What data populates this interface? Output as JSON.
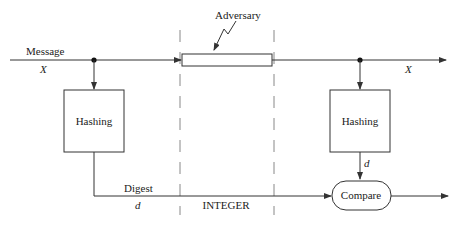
{
  "diagram": {
    "type": "message-integrity-hash-flow",
    "labels": {
      "message": "Message",
      "message_var": "X",
      "output_var": "X",
      "adversary": "Adversary",
      "hashing_left": "Hashing",
      "hashing_right": "Hashing",
      "digest": "Digest",
      "digest_var": "d",
      "right_digest_var": "d",
      "compare": "Compare",
      "channel": "INTEGER"
    },
    "nodes": [
      {
        "id": "hash-sender",
        "label": "Hashing",
        "shape": "rect"
      },
      {
        "id": "channel",
        "label": "",
        "shape": "rect"
      },
      {
        "id": "hash-receiver",
        "label": "Hashing",
        "shape": "rect"
      },
      {
        "id": "compare",
        "label": "Compare",
        "shape": "pill"
      }
    ],
    "edges": [
      {
        "from": "input",
        "to": "channel",
        "label": "Message X"
      },
      {
        "from": "input",
        "to": "hash-sender"
      },
      {
        "from": "hash-sender",
        "to": "compare",
        "label": "Digest d"
      },
      {
        "from": "channel",
        "to": "output",
        "label": "X"
      },
      {
        "from": "channel",
        "to": "hash-receiver"
      },
      {
        "from": "hash-receiver",
        "to": "compare",
        "label": "d"
      },
      {
        "from": "compare",
        "to": "result"
      },
      {
        "from": "adversary",
        "to": "channel"
      }
    ],
    "colors": {
      "stroke": "#333333",
      "dash": "#888888",
      "background": "#ffffff"
    }
  }
}
